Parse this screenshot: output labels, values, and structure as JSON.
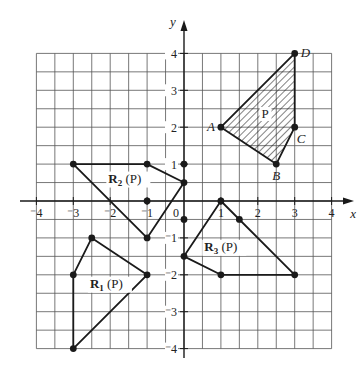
{
  "figure": {
    "origin_px": [
      184,
      201
    ],
    "unit_px": 36.9,
    "grid_range": {
      "xmin": -4,
      "xmax": 4,
      "ymin": -4,
      "ymax": 4,
      "step": 0.5
    },
    "colors": {
      "ink": "#1a1a1a",
      "grid": "#555555",
      "background": "#ffffff"
    },
    "axes": {
      "x_label": "x",
      "y_label": "y",
      "x_ticks": [
        {
          "value": -4,
          "label": "⁻4"
        },
        {
          "value": -3,
          "label": "⁻3"
        },
        {
          "value": -2,
          "label": "⁻2"
        },
        {
          "value": -1,
          "label": "⁻1"
        },
        {
          "value": 0,
          "label": "0"
        },
        {
          "value": 1,
          "label": "1"
        },
        {
          "value": 2,
          "label": "2"
        },
        {
          "value": 3,
          "label": "3"
        },
        {
          "value": 4,
          "label": "4"
        }
      ],
      "y_ticks": [
        {
          "value": 4,
          "label": "4"
        },
        {
          "value": 3,
          "label": "3"
        },
        {
          "value": 2,
          "label": "2"
        },
        {
          "value": 1,
          "label": "1"
        },
        {
          "value": -1,
          "label": "⁻1"
        },
        {
          "value": -2,
          "label": "⁻2"
        },
        {
          "value": -3,
          "label": "⁻3"
        },
        {
          "value": -4,
          "label": "⁻4"
        }
      ]
    },
    "polygons": [
      {
        "id": "P",
        "label": "P",
        "label_pos": [
          2.1,
          2.25
        ],
        "hatched": true,
        "vertices": [
          [
            1,
            2
          ],
          [
            2.5,
            1
          ],
          [
            3,
            2
          ],
          [
            3,
            4
          ]
        ],
        "vertex_labels": [
          {
            "text": "A",
            "at": [
              1,
              2
            ],
            "offset": [
              -14,
              4
            ]
          },
          {
            "text": "B",
            "at": [
              2.5,
              1
            ],
            "offset": [
              -4,
              16
            ]
          },
          {
            "text": "C",
            "at": [
              3,
              2
            ],
            "offset": [
              2,
              16
            ]
          },
          {
            "text": "D",
            "at": [
              3,
              4
            ],
            "offset": [
              6,
              4
            ]
          }
        ]
      },
      {
        "id": "R1",
        "label": "R",
        "sub": "1",
        "suffix": "(P)",
        "label_pos": [
          -2.55,
          -2.35
        ],
        "hatched": false,
        "vertices": [
          [
            -3,
            -2
          ],
          [
            -2.5,
            -1
          ],
          [
            -1,
            -2
          ],
          [
            -3,
            -4
          ]
        ]
      },
      {
        "id": "R2",
        "label": "R",
        "sub": "2",
        "suffix": "(P)",
        "label_pos": [
          -2.05,
          0.5
        ],
        "hatched": false,
        "vertices": [
          [
            -3,
            1
          ],
          [
            -1,
            1
          ],
          [
            0,
            0.5
          ],
          [
            -1,
            -1
          ]
        ]
      },
      {
        "id": "R3",
        "label": "R",
        "sub": "3",
        "suffix": "(P)",
        "label_pos": [
          0.55,
          -1.35
        ],
        "hatched": false,
        "vertices": [
          [
            1,
            0
          ],
          [
            3,
            -2
          ],
          [
            1,
            -2
          ],
          [
            0,
            -1.5
          ]
        ]
      }
    ],
    "extra_points": [
      [
        0,
        1
      ],
      [
        -1,
        0
      ],
      [
        0,
        -0.5
      ],
      [
        1.5,
        -0.5
      ]
    ]
  }
}
